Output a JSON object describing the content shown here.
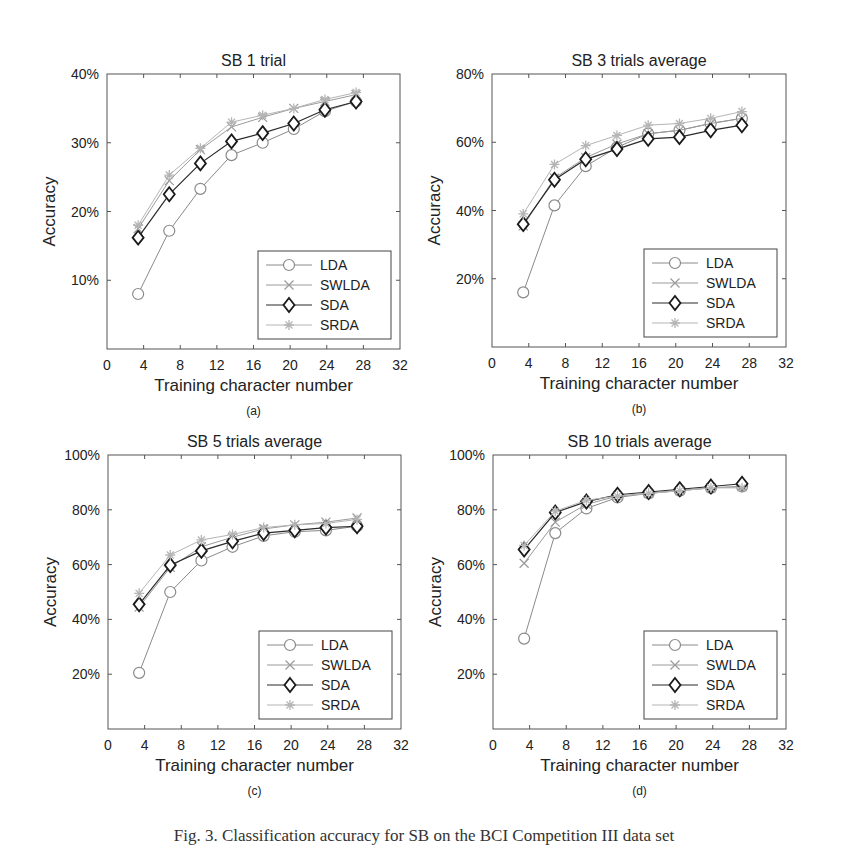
{
  "figure_caption": "Fig. 3. Classification accuracy for SB on the BCI Competition III data set",
  "legend": [
    "LDA",
    "SWLDA",
    "SDA",
    "SRDA"
  ],
  "chart_data": [
    {
      "type": "line",
      "panel": "(a)",
      "title": "SB 1 trial",
      "xlabel": "Training character number",
      "ylabel": "Accuracy",
      "x": [
        3.4,
        6.8,
        10.2,
        13.6,
        17,
        20.4,
        23.8,
        27.2
      ],
      "xlim": [
        0,
        32
      ],
      "xticks": [
        0,
        4,
        8,
        12,
        16,
        20,
        24,
        28,
        32
      ],
      "ylim": [
        0,
        40
      ],
      "yticks": [
        10,
        20,
        30,
        40
      ],
      "ytick_labels": [
        "10%",
        "20%",
        "30%",
        "40%"
      ],
      "grid": false,
      "legend_position": "lower right",
      "series": [
        {
          "name": "LDA",
          "marker": "circle",
          "values": [
            8,
            17.2,
            23.3,
            28.2,
            30,
            32,
            34.6,
            36
          ]
        },
        {
          "name": "SWLDA",
          "marker": "x",
          "values": [
            17.5,
            24.5,
            29,
            32.3,
            33.7,
            35,
            36,
            37
          ]
        },
        {
          "name": "SDA",
          "marker": "diamond",
          "values": [
            16.2,
            22.5,
            27,
            30.2,
            31.4,
            32.8,
            34.8,
            36
          ]
        },
        {
          "name": "SRDA",
          "marker": "star",
          "values": [
            18,
            25.3,
            29.2,
            33,
            34,
            35,
            36.3,
            37.3
          ]
        }
      ]
    },
    {
      "type": "line",
      "panel": "(b)",
      "title": "SB 3 trials average",
      "xlabel": "Training character number",
      "ylabel": "Accuracy",
      "x": [
        3.4,
        6.8,
        10.2,
        13.6,
        17,
        20.4,
        23.8,
        27.2
      ],
      "xlim": [
        0,
        32
      ],
      "xticks": [
        0,
        4,
        8,
        12,
        16,
        20,
        24,
        28,
        32
      ],
      "ylim": [
        0,
        80
      ],
      "yticks": [
        20,
        40,
        60,
        80
      ],
      "ytick_labels": [
        "20%",
        "40%",
        "60%",
        "80%"
      ],
      "grid": false,
      "legend_position": "lower right",
      "series": [
        {
          "name": "LDA",
          "marker": "circle",
          "values": [
            16,
            41.5,
            53,
            58.5,
            62.5,
            63.5,
            65.5,
            67
          ]
        },
        {
          "name": "SWLDA",
          "marker": "x",
          "values": [
            35.5,
            49.5,
            55.5,
            59.5,
            62.5,
            63.5,
            65.5,
            67
          ]
        },
        {
          "name": "SDA",
          "marker": "diamond",
          "values": [
            36,
            49,
            55,
            58,
            61,
            61.5,
            63.5,
            65
          ]
        },
        {
          "name": "SRDA",
          "marker": "star",
          "values": [
            39,
            53.5,
            59,
            62,
            65,
            65.5,
            67,
            69
          ]
        }
      ]
    },
    {
      "type": "line",
      "panel": "(c)",
      "title": "SB 5 trials average",
      "xlabel": "Training character number",
      "ylabel": "Accuracy",
      "x": [
        3.4,
        6.8,
        10.2,
        13.6,
        17,
        20.4,
        23.8,
        27.2
      ],
      "xlim": [
        0,
        32
      ],
      "xticks": [
        0,
        4,
        8,
        12,
        16,
        20,
        24,
        28,
        32
      ],
      "ylim": [
        0,
        100
      ],
      "yticks": [
        20,
        40,
        60,
        80,
        100
      ],
      "ytick_labels": [
        "20%",
        "40%",
        "60%",
        "80%",
        "100%"
      ],
      "grid": false,
      "legend_position": "lower right",
      "series": [
        {
          "name": "LDA",
          "marker": "circle",
          "values": [
            20.5,
            50,
            61.5,
            66.5,
            70.5,
            72,
            72.5,
            74
          ]
        },
        {
          "name": "SWLDA",
          "marker": "x",
          "values": [
            44.5,
            59,
            66.5,
            70,
            73,
            74.5,
            75.5,
            77
          ]
        },
        {
          "name": "SDA",
          "marker": "diamond",
          "values": [
            45.5,
            59.8,
            65,
            68.5,
            71.5,
            72.5,
            73.5,
            74
          ]
        },
        {
          "name": "SRDA",
          "marker": "star",
          "values": [
            49.5,
            63.5,
            69,
            71,
            73.5,
            74.5,
            75,
            76.5
          ]
        }
      ]
    },
    {
      "type": "line",
      "panel": "(d)",
      "title": "SB 10 trials average",
      "xlabel": "Training character number",
      "ylabel": "Accuracy",
      "x": [
        3.4,
        6.8,
        10.2,
        13.6,
        17,
        20.4,
        23.8,
        27.2
      ],
      "xlim": [
        0,
        32
      ],
      "xticks": [
        0,
        4,
        8,
        12,
        16,
        20,
        24,
        28,
        32
      ],
      "ylim": [
        0,
        100
      ],
      "yticks": [
        20,
        40,
        60,
        80,
        100
      ],
      "ytick_labels": [
        "20%",
        "40%",
        "60%",
        "80%",
        "100%"
      ],
      "grid": false,
      "legend_position": "lower right",
      "series": [
        {
          "name": "LDA",
          "marker": "circle",
          "values": [
            33,
            71.5,
            80.5,
            84.5,
            86,
            87,
            88,
            88.5
          ]
        },
        {
          "name": "SWLDA",
          "marker": "x",
          "values": [
            60.5,
            75.5,
            82,
            85,
            86,
            87,
            88,
            88.5
          ]
        },
        {
          "name": "SDA",
          "marker": "diamond",
          "values": [
            65.5,
            79,
            83,
            85.5,
            86.5,
            87.5,
            88.5,
            89.5
          ]
        },
        {
          "name": "SRDA",
          "marker": "star",
          "values": [
            67,
            79.5,
            83.5,
            85,
            86,
            87,
            88,
            88
          ]
        }
      ]
    }
  ]
}
